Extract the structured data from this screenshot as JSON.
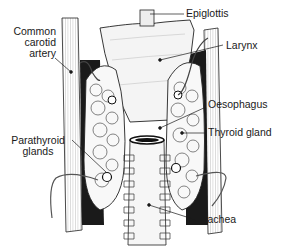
{
  "diagram": {
    "type": "anatomical illustration",
    "labels": [
      {
        "id": "epiglottis",
        "text": "Epiglottis"
      },
      {
        "id": "larynx",
        "text": "Larynx"
      },
      {
        "id": "common-carotid-artery",
        "lines": [
          "Common",
          "carotid",
          "artery"
        ]
      },
      {
        "id": "oesophagus",
        "text": "Oesophagus"
      },
      {
        "id": "thyroid-gland",
        "text": "Thyroid gland"
      },
      {
        "id": "parathyroid-glands",
        "lines": [
          "Parathyroid",
          "glands"
        ]
      },
      {
        "id": "trachea",
        "text": "Trachea"
      }
    ],
    "colors": {
      "ink": "#1a1a1a",
      "background": "#ffffff",
      "shading": "#555555"
    }
  }
}
